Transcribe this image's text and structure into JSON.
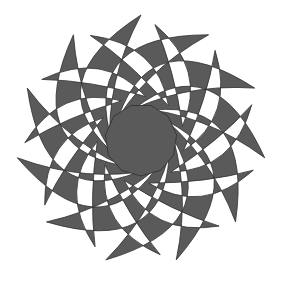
{
  "figure": {
    "title": "Rotational crescent star pattern",
    "arm_count": 11,
    "center": [
      141,
      140
    ],
    "outer_radius": 125,
    "inner_polygon_radius": 36,
    "colors": {
      "fill": "#5a5a5a",
      "stroke": "#2e2e2e",
      "background": "#ffffff"
    }
  }
}
